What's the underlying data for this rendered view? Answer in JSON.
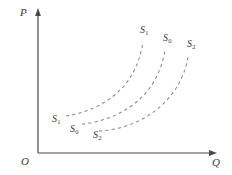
{
  "figure": {
    "background_color": "#ffffff",
    "width": 232,
    "height": 175
  },
  "axes": {
    "color": "#4a4a4a",
    "y_axis_label": "P",
    "x_axis_label": "Q",
    "origin_label": "O",
    "y_axis_x": 38,
    "y_axis_top": 10,
    "x_axis_y": 153,
    "x_axis_right": 215
  },
  "chart_data": {
    "type": "line",
    "title": "",
    "xlabel": "Q",
    "ylabel": "P",
    "grid": false,
    "legend": "none",
    "line_style": "dashed",
    "line_color": "#8a8a8a",
    "series": [
      {
        "name": "S1",
        "label_base": "S",
        "label_sub": "1",
        "path": "M 66 116 C 86 113, 108 104, 124 86 C 136 72, 141 55, 143 42",
        "start": [
          66,
          116
        ],
        "end": [
          143,
          42
        ],
        "start_label_pos": [
          52,
          114
        ],
        "end_label_pos": [
          140,
          25
        ]
      },
      {
        "name": "S0",
        "label_base": "S",
        "label_sub": "0",
        "path": "M 82 124 C 103 122, 127 113, 144 95 C 157 81, 163 63, 165 50",
        "start": [
          82,
          124
        ],
        "end": [
          165,
          50
        ],
        "start_label_pos": [
          70,
          124
        ],
        "end_label_pos": [
          163,
          33
        ]
      },
      {
        "name": "S2",
        "label_base": "S",
        "label_sub": "2",
        "path": "M 99 131 C 121 130, 147 121, 165 102 C 179 88, 186 70, 188 57",
        "start": [
          99,
          131
        ],
        "end": [
          188,
          57
        ],
        "start_label_pos": [
          93,
          130
        ],
        "end_label_pos": [
          187,
          39
        ]
      }
    ]
  }
}
